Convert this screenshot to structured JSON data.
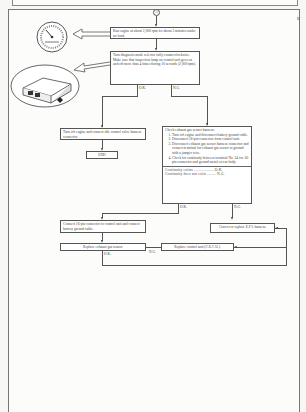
{
  "page": {
    "connector_top": "A",
    "edge_marker": "B"
  },
  "flowchart": {
    "step1": "Run engine at about 2,000 rpm for about 2 minutes under no-load.",
    "step2": {
      "line1": "Turn diagnosis mode selector fully counterclockwise.",
      "line2": "Make sure that inspection lamp on control unit goes on and off more than 4 times during 10 seconds (2,000 rpm)."
    },
    "branch_ok": "O.K.",
    "branch_ng": "N.G.",
    "ok_action": "Turn off engine and connect idle control valve harness connector.",
    "end": "END",
    "check": {
      "title": "Check exhaust gas sensor harness:",
      "steps": [
        "Turn off engine and disconnect battery ground cable.",
        "Disconnect 16-pin connector from control unit.",
        "Disconnect exhaust gas sensor harness connector and connect terminal for exhaust gas sensor to ground with a jumper wire.",
        "Check for continuity between terminal No. 24 for 16-pin connector and ground metal on car body."
      ],
      "result_ok": "Continuity exists .................. O.K.",
      "result_ng": "Continuity does not exist ........ N.G."
    },
    "reconnect": "Connect 16-pin connector to control unit and connect battery ground cable.",
    "correct_harness": "Correct or replace E.F.I. harness.",
    "replace_sensor": "Replace exhaust gas sensor.",
    "replace_unit": "Replace control unit (C.E.C.U.).",
    "label_ok": "O.K.",
    "label_ng": "N.G."
  },
  "illustrations": {
    "tachometer": "tachometer gauge illustration",
    "control_unit": "control unit illustration"
  }
}
